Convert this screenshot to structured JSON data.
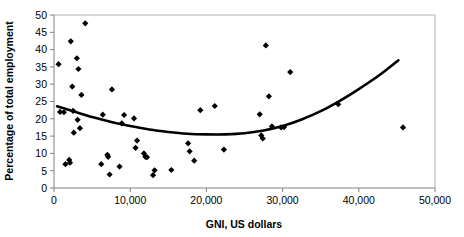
{
  "chart_data": {
    "type": "scatter",
    "title": "",
    "xlabel": "GNI, US dollars",
    "ylabel": "Percentage of total employment",
    "xlim": [
      0,
      50000
    ],
    "ylim": [
      0,
      50
    ],
    "xticks": [
      0,
      10000,
      20000,
      30000,
      40000,
      50000
    ],
    "xtick_labels": [
      "0",
      "10,000",
      "20,000",
      "30,000",
      "40,000",
      "50,000"
    ],
    "yticks": [
      0,
      5,
      10,
      15,
      20,
      25,
      30,
      35,
      40,
      45,
      50
    ],
    "ytick_labels": [
      "0",
      "5",
      "10",
      "15",
      "20",
      "25",
      "30",
      "35",
      "40",
      "45",
      "50"
    ],
    "grid": false,
    "legend": false,
    "marker": "diamond",
    "marker_color": "#000000",
    "points": [
      {
        "x": 600,
        "y": 35.8
      },
      {
        "x": 800,
        "y": 22.0
      },
      {
        "x": 1300,
        "y": 21.9
      },
      {
        "x": 1500,
        "y": 6.9
      },
      {
        "x": 2000,
        "y": 8.1
      },
      {
        "x": 2100,
        "y": 7.3
      },
      {
        "x": 2200,
        "y": 42.4
      },
      {
        "x": 2400,
        "y": 29.3
      },
      {
        "x": 2500,
        "y": 22.3
      },
      {
        "x": 2600,
        "y": 16.0
      },
      {
        "x": 3000,
        "y": 37.5
      },
      {
        "x": 3100,
        "y": 19.7
      },
      {
        "x": 3200,
        "y": 34.4
      },
      {
        "x": 3400,
        "y": 17.3
      },
      {
        "x": 3600,
        "y": 26.9
      },
      {
        "x": 4100,
        "y": 47.6
      },
      {
        "x": 6200,
        "y": 6.9
      },
      {
        "x": 6400,
        "y": 21.2
      },
      {
        "x": 7000,
        "y": 9.6
      },
      {
        "x": 7100,
        "y": 9.0
      },
      {
        "x": 7300,
        "y": 3.9
      },
      {
        "x": 7600,
        "y": 28.5
      },
      {
        "x": 8600,
        "y": 6.2
      },
      {
        "x": 8900,
        "y": 18.7
      },
      {
        "x": 9200,
        "y": 21.1
      },
      {
        "x": 10500,
        "y": 20.1
      },
      {
        "x": 10700,
        "y": 11.6
      },
      {
        "x": 10900,
        "y": 13.7
      },
      {
        "x": 11800,
        "y": 10.0
      },
      {
        "x": 12000,
        "y": 9.0
      },
      {
        "x": 12200,
        "y": 8.9
      },
      {
        "x": 13000,
        "y": 3.7
      },
      {
        "x": 13200,
        "y": 5.1
      },
      {
        "x": 15400,
        "y": 5.2
      },
      {
        "x": 17600,
        "y": 12.9
      },
      {
        "x": 17800,
        "y": 10.6
      },
      {
        "x": 18400,
        "y": 7.9
      },
      {
        "x": 19200,
        "y": 22.5
      },
      {
        "x": 21100,
        "y": 23.7
      },
      {
        "x": 22300,
        "y": 11.1
      },
      {
        "x": 27000,
        "y": 21.3
      },
      {
        "x": 27200,
        "y": 15.2
      },
      {
        "x": 27400,
        "y": 14.3
      },
      {
        "x": 27800,
        "y": 41.2
      },
      {
        "x": 28200,
        "y": 26.5
      },
      {
        "x": 28600,
        "y": 17.8
      },
      {
        "x": 29800,
        "y": 17.5
      },
      {
        "x": 30200,
        "y": 17.6
      },
      {
        "x": 31000,
        "y": 33.5
      },
      {
        "x": 37300,
        "y": 24.2
      },
      {
        "x": 45800,
        "y": 17.5
      }
    ],
    "trend": {
      "type": "quadratic-fit",
      "points": [
        {
          "x": 400,
          "y": 23.6
        },
        {
          "x": 2500,
          "y": 22.2
        },
        {
          "x": 5000,
          "y": 20.5
        },
        {
          "x": 7500,
          "y": 19.1
        },
        {
          "x": 10000,
          "y": 17.9
        },
        {
          "x": 12500,
          "y": 16.9
        },
        {
          "x": 15000,
          "y": 16.2
        },
        {
          "x": 17500,
          "y": 15.7
        },
        {
          "x": 20000,
          "y": 15.5
        },
        {
          "x": 22500,
          "y": 15.5
        },
        {
          "x": 25000,
          "y": 15.8
        },
        {
          "x": 27500,
          "y": 16.6
        },
        {
          "x": 30000,
          "y": 17.9
        },
        {
          "x": 32500,
          "y": 19.8
        },
        {
          "x": 35000,
          "y": 22.2
        },
        {
          "x": 37500,
          "y": 25.2
        },
        {
          "x": 40000,
          "y": 28.6
        },
        {
          "x": 42500,
          "y": 32.3
        },
        {
          "x": 44000,
          "y": 34.8
        },
        {
          "x": 45200,
          "y": 36.9
        }
      ]
    }
  }
}
